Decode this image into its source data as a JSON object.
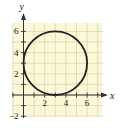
{
  "chart_data": {
    "type": "line",
    "title": "",
    "xlabel": "x",
    "ylabel": "y",
    "xlim": [
      -1,
      7.5
    ],
    "ylim": [
      -2,
      6.8
    ],
    "grid": true,
    "x_ticks": [
      {
        "value": 2,
        "label": "2"
      },
      {
        "value": 4,
        "label": "4"
      },
      {
        "value": 6,
        "label": "6"
      }
    ],
    "y_ticks": [
      {
        "value": -2,
        "label": "−2"
      },
      {
        "value": 2,
        "label": "2"
      },
      {
        "value": 4,
        "label": "4"
      },
      {
        "value": 6,
        "label": "6"
      }
    ],
    "series": [
      {
        "name": "circle",
        "shape": "circle",
        "center": [
          3,
          3
        ],
        "radius": 3,
        "equation": "(x-3)^2 + (y-3)^2 = 9"
      }
    ],
    "colors": {
      "background": "#fbf8d8",
      "grid": "#d9d5ae",
      "axis": "#333333",
      "curve": "#222222"
    }
  }
}
